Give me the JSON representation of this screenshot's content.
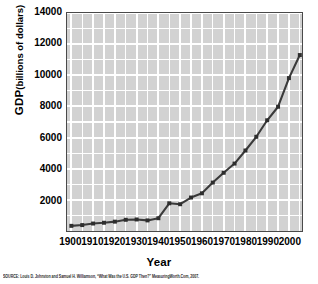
{
  "chart_data": {
    "type": "line",
    "title": "",
    "xlabel": "Year",
    "ylabel_main": "GDP",
    "ylabel_sub": "(billions of dollars)",
    "ylabel": "GDP (billions of dollars)",
    "xlim": [
      1898,
      2006
    ],
    "ylim": [
      0,
      14000
    ],
    "grid": true,
    "legend": false,
    "ytick_labels": [
      "14000",
      "12000",
      "10000",
      "8000",
      "6000",
      "4000",
      "2000"
    ],
    "ytick_values": [
      14000,
      12000,
      10000,
      8000,
      6000,
      4000,
      2000
    ],
    "ytick_minor_step": 1000,
    "xtick_labels": [
      "1900",
      "1910",
      "1920",
      "1930",
      "1940",
      "1950",
      "1960",
      "1970",
      "1980",
      "1990",
      "2000"
    ],
    "xtick_values": [
      1900,
      1910,
      1920,
      1930,
      1940,
      1950,
      1960,
      1970,
      1980,
      1990,
      2000
    ],
    "xtick_minor_step": 5,
    "marker": "square",
    "line_color": "#3a3a3a",
    "marker_color": "#2e2e2e",
    "plot_bg_color": "#d2d2d2",
    "grid_color": "#ffffff",
    "axis_color": "#4a4a4a",
    "x": [
      1900,
      1905,
      1910,
      1915,
      1920,
      1925,
      1930,
      1935,
      1940,
      1945,
      1950,
      1955,
      1960,
      1965,
      1970,
      1975,
      1980,
      1985,
      1990,
      1995,
      2000,
      2005
    ],
    "values": [
      330,
      380,
      480,
      530,
      600,
      720,
      740,
      680,
      820,
      1780,
      1720,
      2150,
      2420,
      3110,
      3740,
      4330,
      5170,
      6050,
      7110,
      7980,
      9820,
      11300
    ],
    "series": [
      {
        "name": "U.S. GDP",
        "values": [
          330,
          380,
          480,
          530,
          600,
          720,
          740,
          680,
          820,
          1780,
          1720,
          2150,
          2420,
          3110,
          3740,
          4330,
          5170,
          6050,
          7110,
          7980,
          9820,
          11300
        ]
      }
    ]
  },
  "footer": {
    "source": "SOURCE: Louis D. Johnston and Samuel H. Williamson, “What Was the U.S. GDP Then?” MeasuringWorth.Com, 2007."
  }
}
